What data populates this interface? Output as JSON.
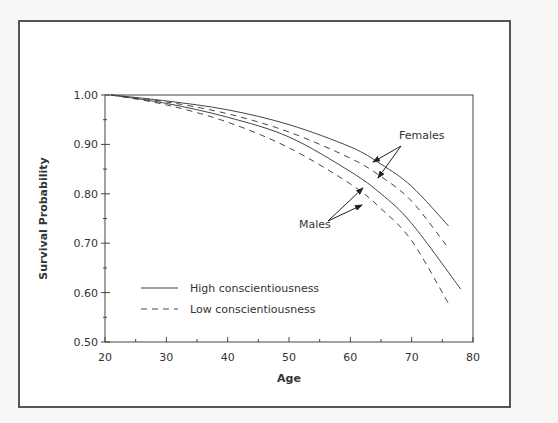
{
  "chart_data": {
    "type": "line",
    "title": "",
    "xlabel": "Age",
    "ylabel": "Survival Probability",
    "xlim": [
      20,
      80
    ],
    "ylim": [
      0.5,
      1.0
    ],
    "xticks": [
      20,
      30,
      40,
      50,
      60,
      70,
      80
    ],
    "xtick_labels": [
      "20",
      "30",
      "40",
      "50",
      "60",
      "70",
      "80"
    ],
    "yticks": [
      0.5,
      0.6,
      0.7,
      0.8,
      0.9,
      1.0
    ],
    "ytick_labels": [
      "0.50",
      "0.60",
      "0.70",
      "0.80",
      "0.90",
      "1.00"
    ],
    "grid": false,
    "legend": [
      {
        "label": "High conscientiousness",
        "style": "solid"
      },
      {
        "label": "Low conscientiousness",
        "style": "dashed"
      }
    ],
    "annotations": [
      {
        "text": "Females",
        "x": 66,
        "y": 0.91
      },
      {
        "text": "Males",
        "x": 55,
        "y": 0.735
      }
    ],
    "series": [
      {
        "name": "Females, high conscientiousness",
        "style": "solid",
        "x": [
          21,
          30,
          40,
          50,
          60,
          65,
          70,
          76
        ],
        "values": [
          1.0,
          0.988,
          0.97,
          0.94,
          0.895,
          0.86,
          0.815,
          0.735
        ]
      },
      {
        "name": "Females, low conscientiousness",
        "style": "dashed",
        "x": [
          21,
          30,
          40,
          50,
          60,
          65,
          70,
          76
        ],
        "values": [
          1.0,
          0.986,
          0.962,
          0.925,
          0.872,
          0.835,
          0.785,
          0.69
        ]
      },
      {
        "name": "Males, high conscientiousness",
        "style": "solid",
        "x": [
          21,
          30,
          40,
          50,
          60,
          65,
          70,
          78
        ],
        "values": [
          1.0,
          0.983,
          0.955,
          0.915,
          0.845,
          0.8,
          0.74,
          0.607
        ]
      },
      {
        "name": "Males, low conscientiousness",
        "style": "dashed",
        "x": [
          21,
          30,
          40,
          50,
          60,
          65,
          70,
          76
        ],
        "values": [
          1.0,
          0.98,
          0.945,
          0.893,
          0.82,
          0.77,
          0.705,
          0.578
        ]
      }
    ]
  }
}
